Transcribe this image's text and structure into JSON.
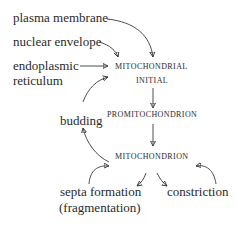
{
  "diagram": {
    "sources": {
      "plasma_membrane": "plasma membrane",
      "nuclear_envelope": "nuclear envelope",
      "endoplasmic_reticulum_line1": "endoplasmic",
      "endoplasmic_reticulum_line2": "reticulum"
    },
    "stages": {
      "initial_line1": "Mitochondrial",
      "initial_line2": "Initial",
      "promitochondrion": "Promitochondrion",
      "mitochondrion": "Mitochondrion"
    },
    "processes": {
      "budding": "budding",
      "septa_line1": "septa formation",
      "septa_line2": "(fragmentation)",
      "constriction": "constriction"
    },
    "edges": [
      {
        "from": "plasma membrane",
        "to": "Mitochondrial Initial"
      },
      {
        "from": "nuclear envelope",
        "to": "Mitochondrial Initial"
      },
      {
        "from": "endoplasmic reticulum",
        "to": "Mitochondrial Initial"
      },
      {
        "from": "Mitochondrial Initial",
        "to": "Promitochondrion"
      },
      {
        "from": "Promitochondrion",
        "to": "Mitochondrion"
      },
      {
        "from": "Mitochondrion",
        "to": "budding"
      },
      {
        "from": "budding",
        "to": "Mitochondrial Initial"
      },
      {
        "from": "Mitochondrion",
        "to": "septa formation (fragmentation)"
      },
      {
        "from": "septa formation (fragmentation)",
        "to": "Mitochondrion"
      },
      {
        "from": "Mitochondrion",
        "to": "constriction"
      },
      {
        "from": "constriction",
        "to": "Mitochondrion"
      }
    ],
    "colors": {
      "text": "#2a2a2a",
      "arrow": "#3a3a3a",
      "background": "#ffffff"
    }
  }
}
